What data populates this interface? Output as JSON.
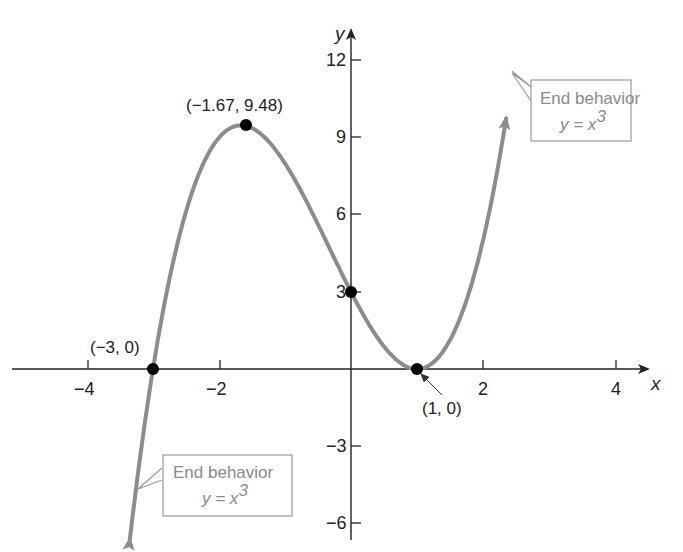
{
  "chart_data": {
    "type": "line",
    "title": "",
    "function": "y = (x + 3)(x - 1)^2 = x^3 + x^2 - 5x + 3",
    "xlabel": "x",
    "ylabel": "y",
    "xlim": [
      -5.3,
      4.6
    ],
    "ylim": [
      -7.2,
      14
    ],
    "grid": false,
    "x_ticks": [
      -4,
      -2,
      2,
      4
    ],
    "x_tick_labels": [
      "−4",
      "−2",
      "2",
      "4"
    ],
    "y_ticks": [
      12,
      9,
      6,
      3,
      -3,
      -6
    ],
    "y_tick_labels": [
      "12",
      "9",
      "6",
      "3",
      "−3",
      "−6"
    ],
    "series": [
      {
        "name": "f(x)",
        "color": "#8c8c8c",
        "x": [
          -3.35,
          -3.2,
          -3.0,
          -2.8,
          -2.6,
          -2.4,
          -2.2,
          -2.0,
          -1.8,
          -1.67,
          -1.5,
          -1.2,
          -1.0,
          -0.8,
          -0.5,
          -0.2,
          0.0,
          0.2,
          0.4,
          0.6,
          0.8,
          1.0,
          1.2,
          1.4,
          1.6,
          1.8,
          2.0,
          2.2,
          2.35
        ],
        "values": [
          -6.6,
          -3.44,
          0.0,
          2.72,
          4.68,
          5.76,
          6.08,
          9.0,
          9.41,
          9.48,
          9.38,
          8.71,
          8.0,
          7.06,
          5.63,
          4.03,
          3.0,
          2.18,
          1.22,
          0.58,
          0.15,
          0.0,
          0.17,
          0.7,
          1.66,
          3.07,
          5.0,
          7.49,
          9.84
        ]
      }
    ],
    "labeled_points": [
      {
        "x": -1.67,
        "y": 9.48,
        "label": "(−1.67, 9.48)"
      },
      {
        "x": -3,
        "y": 0,
        "label": "(−3, 0)"
      },
      {
        "x": 0,
        "y": 3,
        "label": ""
      },
      {
        "x": 1,
        "y": 0,
        "label": "(1, 0)"
      }
    ],
    "annotations": [
      {
        "text": "End behavior",
        "equation": "y = x",
        "exponent": "3",
        "position": "upper-right"
      },
      {
        "text": "End behavior",
        "equation": "y = x",
        "exponent": "3",
        "position": "lower-left"
      }
    ]
  },
  "labels": {
    "x_axis": "x",
    "y_axis": "y",
    "ticks_x": [
      "−4",
      "−2",
      "2",
      "4"
    ],
    "ticks_y": [
      "12",
      "9",
      "6",
      "3",
      "−3",
      "−6"
    ],
    "max_point": "(−1.67, 9.48)",
    "root_left": "(−3, 0)",
    "root_right": "(1, 0)",
    "note_upper_title": "End behavior",
    "note_upper_eq": "y = x",
    "note_upper_exp": "3",
    "note_lower_title": "End behavior",
    "note_lower_eq": "y = x",
    "note_lower_exp": "3"
  },
  "colors": {
    "curve": "#8c8c8c",
    "axis": "#222222",
    "point": "#000000",
    "note_border": "#9a9a9a",
    "note_text": "#8a8a8a"
  }
}
